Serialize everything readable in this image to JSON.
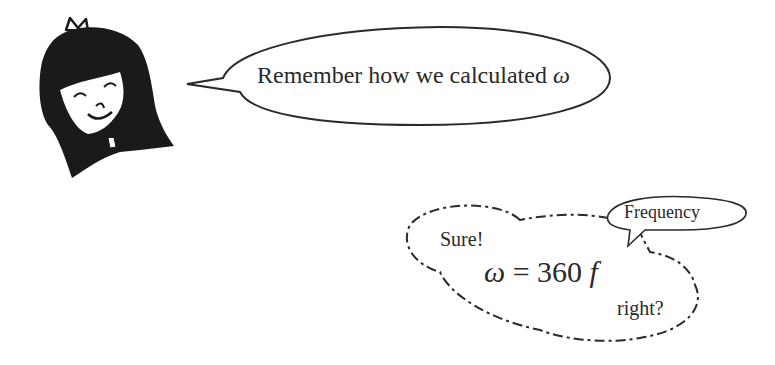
{
  "character": {
    "name": "girl-avatar",
    "expression": "smiling-eyes-closed"
  },
  "speech_bubble": {
    "text": "Remember how we calculated",
    "symbol": "ω"
  },
  "thought_bubble": {
    "greeting": "Sure!",
    "formula": {
      "lhs": "ω",
      "eq": "=",
      "rhs_num": "360",
      "rhs_var": "f"
    },
    "question": "right?"
  },
  "annotation_bubble": {
    "text": "Frequency"
  },
  "colors": {
    "ink": "#2a2a2a",
    "background": "#ffffff"
  }
}
